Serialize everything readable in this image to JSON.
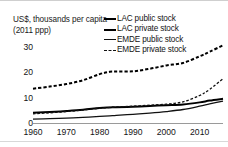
{
  "chart_data": {
    "type": "line",
    "title": "",
    "ylabel": "US$, thousands per capita (2011 ppp)",
    "xlabel": "",
    "xlim": [
      1960,
      2017
    ],
    "ylim": [
      0,
      33
    ],
    "yticks": [
      0,
      10,
      20,
      30
    ],
    "xticks": [
      1960,
      1970,
      1980,
      1990,
      2000,
      2010
    ],
    "grid": false,
    "legend_position": "top-right",
    "x": [
      1960,
      1965,
      1970,
      1975,
      1980,
      1983,
      1985,
      1990,
      1995,
      2000,
      2005,
      2010,
      2013,
      2017
    ],
    "series": [
      {
        "name": "LAC public stock",
        "style": "solid",
        "width": "thick",
        "color": "#000000",
        "values": [
          4.0,
          4.3,
          4.7,
          5.2,
          5.9,
          6.1,
          6.2,
          6.4,
          6.7,
          7.0,
          7.3,
          8.1,
          8.8,
          9.5
        ]
      },
      {
        "name": "LAC private stock",
        "style": "dashed",
        "width": "thick",
        "color": "#000000",
        "values": [
          13.5,
          14.3,
          15.3,
          16.8,
          19.2,
          20.1,
          20.2,
          20.3,
          21.3,
          22.6,
          23.6,
          26.2,
          28.0,
          30.5
        ]
      },
      {
        "name": "EMDE public stock",
        "style": "solid",
        "width": "thin",
        "color": "#111111",
        "values": [
          1.5,
          1.7,
          1.9,
          2.2,
          2.6,
          2.8,
          3.0,
          3.4,
          3.9,
          4.5,
          5.3,
          6.6,
          7.5,
          8.6
        ]
      },
      {
        "name": "EMDE private stock",
        "style": "dashed",
        "width": "thin",
        "color": "#111111",
        "values": [
          3.6,
          4.0,
          4.5,
          5.1,
          5.8,
          6.1,
          6.3,
          6.6,
          7.0,
          7.4,
          8.3,
          10.8,
          13.2,
          17.4
        ]
      }
    ]
  },
  "legend": {
    "items": [
      {
        "label": "LAC public stock",
        "swatch": "solid-thick"
      },
      {
        "label": "LAC private stock",
        "swatch": "dash-thick"
      },
      {
        "label": "EMDE public stock",
        "swatch": "solid-thin"
      },
      {
        "label": "EMDE private stock",
        "swatch": "dash-thin"
      }
    ]
  }
}
